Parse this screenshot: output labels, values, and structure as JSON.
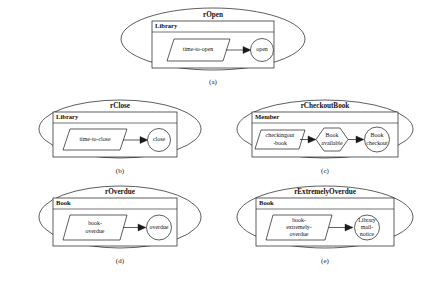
{
  "figure": {
    "background_color": "#ffffff",
    "stroke_color": "#1a1a1a",
    "panels": [
      {
        "id": "a",
        "caption": "(a)",
        "ellipse_label": "rOpen",
        "class_label": "Library",
        "source_label": "time-to-open",
        "source_lines": [
          "time-to-open"
        ],
        "source_shape": "parallelogram",
        "middle_label": "",
        "middle_lines": [],
        "middle_shape": "none",
        "target_label": "open",
        "target_lines": [
          "open"
        ],
        "target_shape": "circle"
      },
      {
        "id": "b",
        "caption": "(b)",
        "ellipse_label": "rClose",
        "class_label": "Library",
        "source_label": "time-to-close",
        "source_lines": [
          "time-to-close"
        ],
        "source_shape": "parallelogram",
        "middle_label": "",
        "middle_lines": [],
        "middle_shape": "none",
        "target_label": "close",
        "target_lines": [
          "close"
        ],
        "target_shape": "circle"
      },
      {
        "id": "c",
        "caption": "(c)",
        "ellipse_label": "rCheckoutBook",
        "class_label": "Member",
        "source_label": "checkingout-book",
        "source_lines": [
          "checkingout",
          "-book"
        ],
        "source_shape": "parallelogram",
        "middle_label": "Book available",
        "middle_lines": [
          "Book",
          "available"
        ],
        "middle_shape": "hexagon",
        "target_label": "Book checkout",
        "target_lines": [
          "Book",
          "checkout"
        ],
        "target_shape": "circle"
      },
      {
        "id": "d",
        "caption": "(d)",
        "ellipse_label": "rOverdue",
        "class_label": "Book",
        "source_label": "book-overdue",
        "source_lines": [
          "book-",
          "overdue"
        ],
        "source_shape": "parallelogram",
        "middle_label": "",
        "middle_lines": [],
        "middle_shape": "none",
        "target_label": "overdue",
        "target_lines": [
          "overdue"
        ],
        "target_shape": "circle"
      },
      {
        "id": "e",
        "caption": "(e)",
        "ellipse_label": "rExtremelyOverdue",
        "class_label": "Book",
        "source_label": "book-extremely-overdue",
        "source_lines": [
          "book-",
          "extremely-",
          "overdue"
        ],
        "source_shape": "parallelogram",
        "middle_label": "",
        "middle_lines": [],
        "middle_shape": "none",
        "target_label": "Library mail-notice",
        "target_lines": [
          "Library",
          "mail-",
          "notice"
        ],
        "target_shape": "circle"
      }
    ]
  }
}
